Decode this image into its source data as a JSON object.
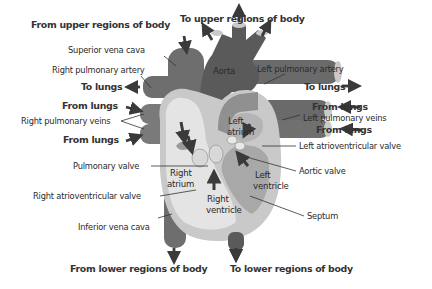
{
  "diagram": {
    "colors": {
      "deoxygenated": "#7a7a7a",
      "oxygenated": "#5a5a5a",
      "heart_wall": "#c9c9c9",
      "chamber": "#e4e4e4",
      "left_ventricle": "#a8a8a8",
      "valve": "#bdbdbd",
      "arrow": "#3a3a3a",
      "text": "#2a2a2a"
    },
    "flow_labels": {
      "from_upper_body": "From upper regions of body",
      "to_upper_body": "To upper regions of body",
      "to_lungs_right": "To lungs",
      "from_lungs_right_1": "From lungs",
      "from_lungs_right_2": "From lungs",
      "to_lungs_left": "To lungs",
      "from_lungs_left_1": "From lungs",
      "from_lungs_left_2": "From lungs",
      "from_lower_body": "From lower regions of body",
      "to_lower_body": "To lower regions of body"
    },
    "structure_labels": {
      "superior_vena_cava": "Superior vena cava",
      "right_pulmonary_artery": "Right pulmonary artery",
      "right_pulmonary_veins": "Right pulmonary veins",
      "pulmonary_valve": "Pulmonary valve",
      "right_av_valve": "Right atrioventricular valve",
      "inferior_vena_cava": "Inferior vena cava",
      "left_pulmonary_artery": "Left pulmonary artery",
      "left_pulmonary_veins": "Left pulmonary veins",
      "left_av_valve": "Left atrioventricular valve",
      "aortic_valve": "Aortic valve",
      "septum": "Septum"
    },
    "chamber_labels": {
      "aorta": "Aorta",
      "left_atrium_1": "Left",
      "left_atrium_2": "atrium",
      "right_atrium_1": "Right",
      "right_atrium_2": "atrium",
      "left_ventricle_1": "Left",
      "left_ventricle_2": "ventricle",
      "right_ventricle_1": "Right",
      "right_ventricle_2": "ventricle"
    }
  }
}
